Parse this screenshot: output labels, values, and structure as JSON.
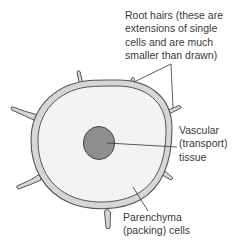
{
  "diagram": {
    "type": "cross-section of a root",
    "labels": {
      "root_hairs": "Root hairs (these are\nextensions of single\ncells and are much\nsmaller than drawn)",
      "vascular": "Vascular\n(transport)\ntissue",
      "parenchyma": "Parenchyma\n(packing) cells"
    },
    "colors": {
      "outline": "#555555",
      "ring_fill": "#d6d6d6",
      "inner_fill": "#f3f3f3",
      "vascular_fill": "#8e8e8e",
      "leader_line": "#333333",
      "text": "#3a3a3a"
    },
    "parts": [
      {
        "name": "epidermis-ring",
        "description": "outer cortex ring"
      },
      {
        "name": "parenchyma-region",
        "description": "inner packing cells"
      },
      {
        "name": "vascular-core",
        "description": "central transport tissue"
      },
      {
        "name": "root-hairs",
        "count": 7
      }
    ]
  }
}
